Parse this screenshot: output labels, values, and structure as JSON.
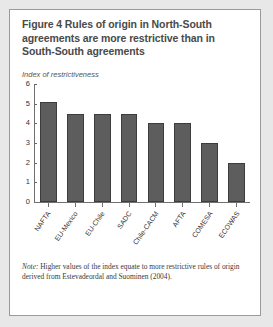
{
  "figure": {
    "title": "Figure 4  Rules of origin in North-South agreements are more restrictive than in South-South agreements",
    "note_label": "Note:",
    "note": "Higher values of the index equate to more restrictive rules of origin derived from Estevadeordal and Suominen (2004).",
    "border_color": "#9a9a9a",
    "background": "#ffffff"
  },
  "chart_data": {
    "type": "bar",
    "title": "Figure 4  Rules of origin in North-South agreements are more restrictive than in South-South agreements",
    "subtitle": "Index of restrictiveness",
    "xlabel": "",
    "ylabel": "Index of restrictiveness",
    "ylim": [
      0,
      6
    ],
    "yticks": [
      0,
      1,
      2,
      3,
      4,
      5,
      6
    ],
    "grid": false,
    "legend": false,
    "bar_color": "#5d5d5d",
    "bar_edge_color": "#3c3c3c",
    "categories": [
      "NAFTA",
      "EU-Mexico",
      "EU-Chile",
      "SADC",
      "Chile-CACM",
      "AFTA",
      "COMESA",
      "ECOWAS"
    ],
    "values": [
      5.1,
      4.5,
      4.5,
      4.5,
      4.0,
      4.0,
      3.0,
      2.0
    ]
  }
}
